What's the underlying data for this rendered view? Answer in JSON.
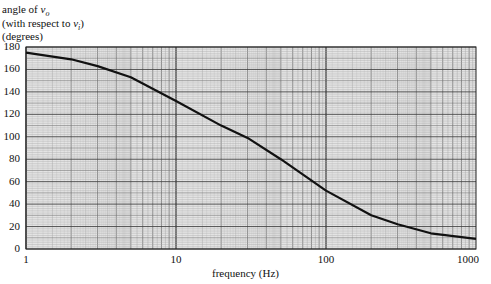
{
  "chart_data": {
    "type": "line",
    "title": "",
    "ylabel_lines": [
      "angle of v_o",
      "(with respect to v_i)",
      "(degrees)"
    ],
    "xlabel": "frequency (Hz)",
    "xscale": "log",
    "xlim": [
      1,
      1000
    ],
    "ylim": [
      0,
      180
    ],
    "x_ticks": [
      "1",
      "10",
      "100",
      "1000"
    ],
    "y_ticks": [
      "0",
      "20",
      "40",
      "60",
      "80",
      "100",
      "120",
      "140",
      "160",
      "180"
    ],
    "grid": true,
    "legend": null,
    "series": [
      {
        "name": "angle of v_o",
        "x": [
          1,
          2,
          3,
          5,
          10,
          20,
          30,
          50,
          100,
          200,
          300,
          500,
          1000
        ],
        "values": [
          175,
          169,
          163,
          153,
          132,
          110,
          99,
          80,
          52,
          30,
          22,
          14,
          9
        ]
      }
    ]
  },
  "labels": {
    "y1_prefix": "angle of ",
    "y1_var": "v",
    "y1_sub": "o",
    "y2_prefix": "(with respect to ",
    "y2_var": "v",
    "y2_sub": "i",
    "y2_suffix": ")",
    "y3": "(degrees)",
    "x_title": "frequency (Hz)"
  }
}
